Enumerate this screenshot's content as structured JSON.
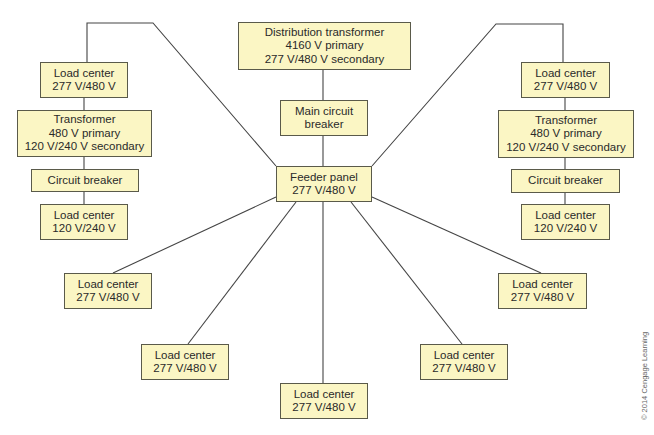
{
  "colors": {
    "box_fill": "#fbf6c4",
    "box_border": "#5a5a4a",
    "wire": "#444444"
  },
  "boxes": {
    "distribution_transformer": {
      "lines": [
        "Distribution transformer",
        "4160 V primary",
        "277 V/480 V secondary"
      ]
    },
    "main_circuit_breaker": {
      "lines": [
        "Main circuit",
        "breaker"
      ]
    },
    "feeder_panel": {
      "lines": [
        "Feeder panel",
        "277 V/480 V"
      ]
    },
    "left_branch": {
      "load_center_top": {
        "lines": [
          "Load center",
          "277 V/480 V"
        ]
      },
      "transformer": {
        "lines": [
          "Transformer",
          "480 V primary",
          "120 V/240 V secondary"
        ]
      },
      "circuit_breaker": {
        "lines": [
          "Circuit breaker"
        ]
      },
      "load_center_bottom": {
        "lines": [
          "Load center",
          "120 V/240 V"
        ]
      }
    },
    "right_branch": {
      "load_center_top": {
        "lines": [
          "Load center",
          "277 V/480 V"
        ]
      },
      "transformer": {
        "lines": [
          "Transformer",
          "480 V primary",
          "120 V/240 V secondary"
        ]
      },
      "circuit_breaker": {
        "lines": [
          "Circuit breaker"
        ]
      },
      "load_center_bottom": {
        "lines": [
          "Load center",
          "120 V/240 V"
        ]
      }
    },
    "radial_load_centers": [
      {
        "lines": [
          "Load center",
          "277 V/480 V"
        ]
      },
      {
        "lines": [
          "Load center",
          "277 V/480 V"
        ]
      },
      {
        "lines": [
          "Load center",
          "277 V/480 V"
        ]
      },
      {
        "lines": [
          "Load center",
          "277 V/480 V"
        ]
      },
      {
        "lines": [
          "Load center",
          "277 V/480 V"
        ]
      }
    ]
  },
  "copyright": "© 2014 Cengage Learning"
}
